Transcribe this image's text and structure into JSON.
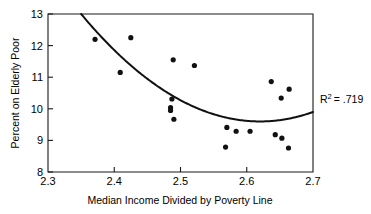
{
  "chart_data": {
    "type": "scatter",
    "title": "",
    "xlabel": "Median Income Divided by Poverty Line",
    "ylabel": "Percent on Elderly Poor",
    "xlim": [
      2.3,
      2.7
    ],
    "ylim": [
      8,
      13
    ],
    "xticks": [
      "2.3",
      "2.4",
      "2.5",
      "2.6",
      "2.7"
    ],
    "xtick_values": [
      2.3,
      2.4,
      2.5,
      2.6,
      2.7
    ],
    "yticks": [
      "8",
      "9",
      "10",
      "11",
      "12",
      "13"
    ],
    "ytick_values": [
      8,
      9,
      10,
      11,
      12,
      13
    ],
    "grid": false,
    "legend": null,
    "annotations": [
      {
        "name": "r-squared",
        "text": "R2 = .719",
        "symbol": "R",
        "superscript": "2",
        "rest": "= .719",
        "value": 0.719,
        "x": 2.71,
        "y": 10.4
      }
    ],
    "points": [
      {
        "x": 2.371,
        "y": 12.2
      },
      {
        "x": 2.425,
        "y": 12.25
      },
      {
        "x": 2.409,
        "y": 11.15
      },
      {
        "x": 2.489,
        "y": 11.55
      },
      {
        "x": 2.521,
        "y": 11.37
      },
      {
        "x": 2.487,
        "y": 10.31
      },
      {
        "x": 2.485,
        "y": 10.04
      },
      {
        "x": 2.485,
        "y": 9.95
      },
      {
        "x": 2.49,
        "y": 9.67
      },
      {
        "x": 2.637,
        "y": 10.86
      },
      {
        "x": 2.664,
        "y": 10.62
      },
      {
        "x": 2.652,
        "y": 10.34
      },
      {
        "x": 2.57,
        "y": 9.41
      },
      {
        "x": 2.584,
        "y": 9.29
      },
      {
        "x": 2.605,
        "y": 9.29
      },
      {
        "x": 2.643,
        "y": 9.18
      },
      {
        "x": 2.653,
        "y": 9.07
      },
      {
        "x": 2.568,
        "y": 8.79
      },
      {
        "x": 2.663,
        "y": 8.76
      }
    ],
    "fit_curve": {
      "type": "quadratic",
      "description": "downward then upward U-shaped regression curve",
      "vertex_x": 2.62,
      "vertex_y": 9.6,
      "entry_x": 2.35,
      "entry_y": 13.0,
      "exit_x": 2.7,
      "exit_y": 10.15
    }
  }
}
